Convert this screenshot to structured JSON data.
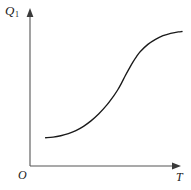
{
  "chart_data": {
    "type": "line",
    "title": "",
    "xlabel": "T",
    "ylabel": "Q",
    "ylabel_sub": "1",
    "origin_label": "O",
    "grid": false,
    "legend": null,
    "axis_style": "arrow-ended half-axes",
    "xlim": [
      0,
      1
    ],
    "ylim": [
      0,
      1
    ],
    "curve_color": "#1a1a1a",
    "axis_color": "#555555",
    "series": [
      {
        "name": "Q1(T)",
        "x": [
          0.053,
          0.105,
          0.158,
          0.211,
          0.263,
          0.316,
          0.368,
          0.421,
          0.474,
          0.526,
          0.553,
          0.579,
          0.605,
          0.632,
          0.658,
          0.684,
          0.711,
          0.763,
          0.816,
          0.868,
          0.921,
          0.974,
          1.0
        ],
        "y": [
          0.186,
          0.19,
          0.199,
          0.213,
          0.233,
          0.261,
          0.297,
          0.342,
          0.397,
          0.462,
          0.5,
          0.544,
          0.592,
          0.639,
          0.682,
          0.72,
          0.753,
          0.8,
          0.833,
          0.857,
          0.873,
          0.882,
          0.885
        ]
      }
    ],
    "annotations": []
  },
  "meta": {
    "background_color": "#ffffff"
  }
}
